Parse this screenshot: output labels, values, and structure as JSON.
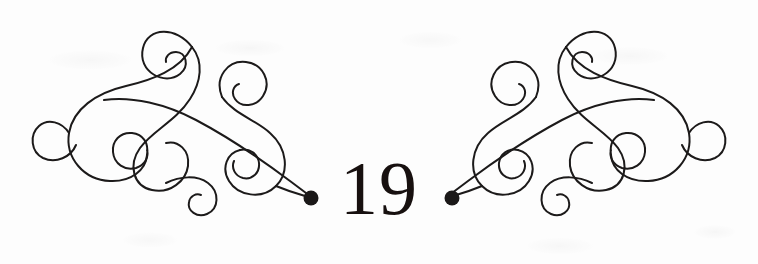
{
  "page": {
    "kind": "scanned-book-page-ornament",
    "page_number": "19",
    "background_color": "#fdfdfd",
    "ink_color": "#1c1a1a"
  },
  "ornament": {
    "name": "calligraphic-flourish-pair",
    "description": "Mirror-symmetric pair of engraved arabesque flourishes composed of interlocking spirals, each terminating in a solid round dot pointing toward the page number.",
    "left": {
      "label": "left-flourish",
      "terminal_dot": {
        "cx": 311,
        "cy": 198,
        "r": 7.5
      }
    },
    "right": {
      "label": "right-flourish",
      "terminal_dot": {
        "cx": 452,
        "cy": 200,
        "r": 7.5
      }
    },
    "stroke_width": 2
  }
}
